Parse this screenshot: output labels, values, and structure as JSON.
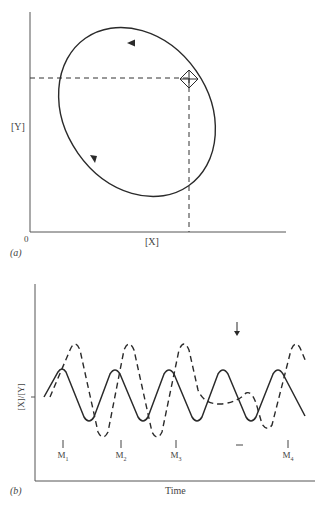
{
  "panel_a": {
    "label": "(a)",
    "x_axis_label": "[X]",
    "y_axis_label": "[Y]",
    "origin_label": "0",
    "description": "Limit cycle in [X]-[Y] phase plane, traversed counter-clockwise, with a marked point (diamond) projected to both axes by dashed lines"
  },
  "panel_b": {
    "label": "(b)",
    "x_axis_label": "Time",
    "y_axis_label": "[X]/[Y]",
    "markers": [
      {
        "base": "M",
        "sub": "1"
      },
      {
        "base": "M",
        "sub": "2"
      },
      {
        "base": "M",
        "sub": "3"
      },
      {
        "base": "M",
        "sub": "4"
      }
    ],
    "arrow_note": "perturbation",
    "series": [
      {
        "name": "[X]",
        "style": "solid"
      },
      {
        "name": "[Y]",
        "style": "dashed"
      }
    ]
  },
  "colors": {
    "ink": "#2a2a2a",
    "background": "#ffffff"
  }
}
